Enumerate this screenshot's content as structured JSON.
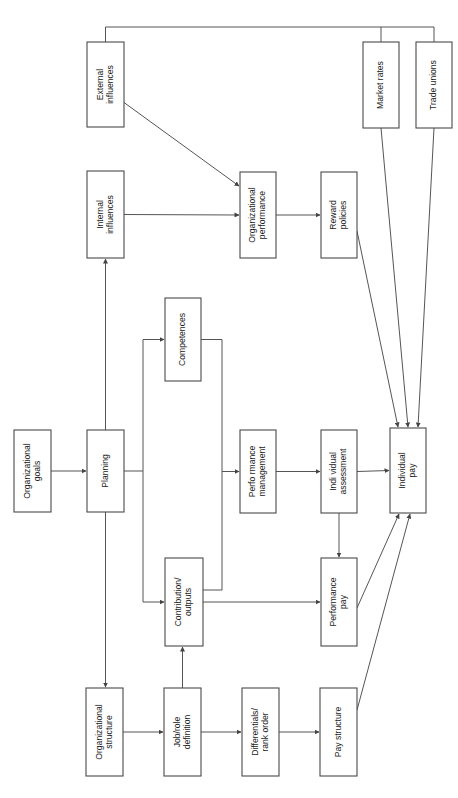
{
  "diagram": {
    "orientation": "rotated-90-ccw",
    "background_color": "#ffffff",
    "box_fill": "#ffffff",
    "box_stroke": "#4a4a4a",
    "line_color": "#555555",
    "text_color": "#1a1a1a",
    "nodes": [
      {
        "id": "organizational-goals",
        "lines": [
          "Organizational",
          "goals"
        ],
        "x": 14,
        "y": 430,
        "w": 37,
        "h": 82
      },
      {
        "id": "planning",
        "lines": [
          "Planning"
        ],
        "x": 87,
        "y": 430,
        "w": 37,
        "h": 82
      },
      {
        "id": "internal-influences",
        "lines": [
          "Internal",
          "influences"
        ],
        "x": 87,
        "y": 171,
        "w": 37,
        "h": 87
      },
      {
        "id": "external-influences",
        "lines": [
          "External",
          "influences"
        ],
        "x": 87,
        "y": 42,
        "w": 37,
        "h": 85
      },
      {
        "id": "organizational-performance",
        "lines": [
          "Organizational",
          "performance"
        ],
        "x": 240,
        "y": 172,
        "w": 36,
        "h": 86
      },
      {
        "id": "reward-policies",
        "lines": [
          "Reward",
          "policies"
        ],
        "x": 321,
        "y": 172,
        "w": 36,
        "h": 86
      },
      {
        "id": "market-rates",
        "lines": [
          "Market rates"
        ],
        "x": 363,
        "y": 42,
        "w": 36,
        "h": 86
      },
      {
        "id": "trade-unions",
        "lines": [
          "Trade unions"
        ],
        "x": 416,
        "y": 42,
        "w": 36,
        "h": 86
      },
      {
        "id": "competences",
        "lines": [
          "Competences"
        ],
        "x": 165,
        "y": 298,
        "w": 36,
        "h": 83
      },
      {
        "id": "contribution-outputs",
        "lines": [
          "Contribution/",
          "outputs"
        ],
        "x": 165,
        "y": 558,
        "w": 38,
        "h": 88
      },
      {
        "id": "performance-management",
        "lines": [
          "Perfo rmance",
          "management"
        ],
        "x": 240,
        "y": 430,
        "w": 36,
        "h": 83
      },
      {
        "id": "individual-assessment",
        "lines": [
          "Indi vidual",
          "assessment"
        ],
        "x": 321,
        "y": 430,
        "w": 36,
        "h": 83
      },
      {
        "id": "individual-pay",
        "lines": [
          "Individual",
          "pay"
        ],
        "x": 390,
        "y": 428,
        "w": 36,
        "h": 85
      },
      {
        "id": "performance-pay",
        "lines": [
          "Performance",
          "pay"
        ],
        "x": 321,
        "y": 558,
        "w": 36,
        "h": 88
      },
      {
        "id": "organizational-structure",
        "lines": [
          "Organizational",
          "structure"
        ],
        "x": 86,
        "y": 688,
        "w": 37,
        "h": 88
      },
      {
        "id": "job-role-definition",
        "lines": [
          "Job/role",
          "definition"
        ],
        "x": 164,
        "y": 688,
        "w": 37,
        "h": 88
      },
      {
        "id": "differentials-rank-order",
        "lines": [
          "Differentials/",
          "rank order"
        ],
        "x": 242,
        "y": 688,
        "w": 37,
        "h": 88
      },
      {
        "id": "pay-structure",
        "lines": [
          "Pay structure"
        ],
        "x": 320,
        "y": 688,
        "w": 37,
        "h": 88
      }
    ],
    "edges": [
      {
        "id": "goals-to-planning",
        "from": "organizational-goals",
        "to": "planning"
      },
      {
        "id": "planning-to-internal-influences",
        "from": "planning",
        "to": "internal-influences"
      },
      {
        "id": "planning-to-competences",
        "from": "planning",
        "to": "competences"
      },
      {
        "id": "planning-to-contribution",
        "from": "planning",
        "to": "contribution-outputs"
      },
      {
        "id": "planning-to-org-structure",
        "from": "planning",
        "to": "organizational-structure"
      },
      {
        "id": "internal-to-org-performance",
        "from": "internal-influences",
        "to": "organizational-performance"
      },
      {
        "id": "external-to-org-performance",
        "from": "external-influences",
        "to": "organizational-performance"
      },
      {
        "id": "external-to-market-trade-bus",
        "from": "external-influences",
        "to": "market-rates"
      },
      {
        "id": "org-performance-to-reward-policies",
        "from": "organizational-performance",
        "to": "reward-policies"
      },
      {
        "id": "competences-to-perf-management",
        "from": "competences",
        "to": "performance-management"
      },
      {
        "id": "contribution-to-perf-management",
        "from": "contribution-outputs",
        "to": "performance-management"
      },
      {
        "id": "contribution-to-performance-pay",
        "from": "contribution-outputs",
        "to": "performance-pay"
      },
      {
        "id": "perf-management-to-individual-assessment",
        "from": "performance-management",
        "to": "individual-assessment"
      },
      {
        "id": "individual-assessment-to-individual-pay",
        "from": "individual-assessment",
        "to": "individual-pay"
      },
      {
        "id": "individual-assessment-to-performance-pay",
        "from": "individual-assessment",
        "to": "performance-pay"
      },
      {
        "id": "reward-policies-to-individual-pay",
        "from": "reward-policies",
        "to": "individual-pay"
      },
      {
        "id": "market-rates-to-individual-pay",
        "from": "market-rates",
        "to": "individual-pay"
      },
      {
        "id": "trade-unions-to-individual-pay",
        "from": "trade-unions",
        "to": "individual-pay"
      },
      {
        "id": "performance-pay-to-individual-pay",
        "from": "performance-pay",
        "to": "individual-pay"
      },
      {
        "id": "pay-structure-to-individual-pay",
        "from": "pay-structure",
        "to": "individual-pay"
      },
      {
        "id": "org-structure-to-job-role",
        "from": "organizational-structure",
        "to": "job-role-definition"
      },
      {
        "id": "job-role-to-contribution",
        "from": "job-role-definition",
        "to": "contribution-outputs"
      },
      {
        "id": "job-role-to-differentials",
        "from": "job-role-definition",
        "to": "differentials-rank-order"
      },
      {
        "id": "differentials-to-pay-structure",
        "from": "differentials-rank-order",
        "to": "pay-structure"
      }
    ]
  }
}
